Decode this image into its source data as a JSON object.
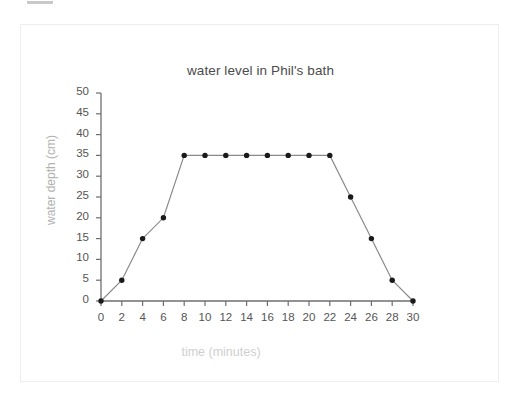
{
  "figure": {
    "background_color": "#ffffff",
    "frame_color": "#eeeeee",
    "top_mark_color": "#c9c9c9"
  },
  "chart_data": {
    "type": "line",
    "title": "water level in Phil's bath",
    "xlabel": "time (minutes)",
    "ylabel": "water depth (cm)",
    "xlim": [
      0,
      30
    ],
    "ylim": [
      0,
      50
    ],
    "xticks": [
      0,
      2,
      4,
      6,
      8,
      10,
      12,
      14,
      16,
      18,
      20,
      22,
      24,
      26,
      28,
      30
    ],
    "yticks": [
      0,
      5,
      10,
      15,
      20,
      25,
      30,
      35,
      40,
      45,
      50
    ],
    "xtick_labels": [
      "0",
      "2",
      "4",
      "6",
      "8",
      "10",
      "12",
      "14",
      "16",
      "18",
      "20",
      "22",
      "24",
      "26",
      "28",
      "30"
    ],
    "ytick_labels": [
      "0",
      "5",
      "10",
      "15",
      "20",
      "25",
      "30",
      "35",
      "40",
      "45",
      "50"
    ],
    "grid": false,
    "legend": false,
    "marker": "filled-circle",
    "marker_color": "#1a1a1a",
    "line_color": "#8a8a8a",
    "x": [
      0,
      2,
      4,
      6,
      8,
      10,
      12,
      14,
      16,
      18,
      20,
      22,
      24,
      26,
      28,
      30
    ],
    "values": [
      0,
      5,
      15,
      20,
      35,
      35,
      35,
      35,
      35,
      35,
      35,
      35,
      25,
      15,
      5,
      0
    ],
    "series": [
      {
        "name": "water depth",
        "values": [
          0,
          5,
          15,
          20,
          35,
          35,
          35,
          35,
          35,
          35,
          35,
          35,
          25,
          15,
          5,
          0
        ]
      }
    ]
  }
}
